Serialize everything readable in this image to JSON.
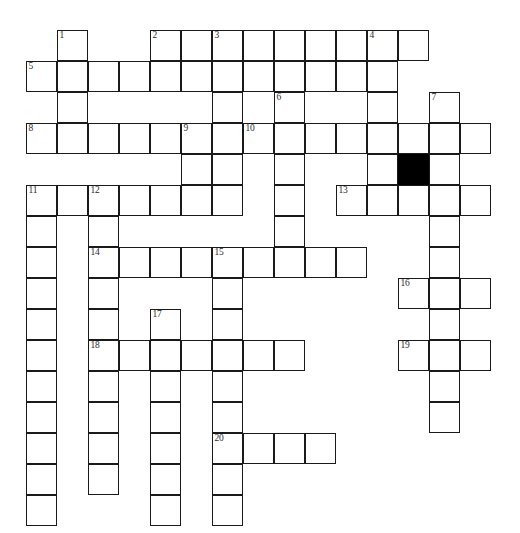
{
  "puzzle": {
    "title": "Crossword Puzzle Grid",
    "grid": {
      "columns": 15,
      "rows": 16,
      "cell_size": 31,
      "origin_x": 26,
      "origin_y": 30,
      "border_color": "#1a1a1a",
      "cell_fill": "#ffffff",
      "blocked_fill": "#000000",
      "background": "#ffffff"
    },
    "blocked_cells": [
      {
        "col": 12,
        "row": 4
      }
    ],
    "numbers": [
      {
        "label": "1",
        "col": 1,
        "row": 0
      },
      {
        "label": "2",
        "col": 4,
        "row": 0
      },
      {
        "label": "3",
        "col": 6,
        "row": 0
      },
      {
        "label": "4",
        "col": 11,
        "row": 0
      },
      {
        "label": "5",
        "col": 0,
        "row": 1
      },
      {
        "label": "6",
        "col": 8,
        "row": 2
      },
      {
        "label": "7",
        "col": 13,
        "row": 2
      },
      {
        "label": "8",
        "col": 0,
        "row": 3
      },
      {
        "label": "9",
        "col": 5,
        "row": 3
      },
      {
        "label": "10",
        "col": 7,
        "row": 3
      },
      {
        "label": "11",
        "col": 0,
        "row": 5
      },
      {
        "label": "12",
        "col": 2,
        "row": 5
      },
      {
        "label": "13",
        "col": 10,
        "row": 5
      },
      {
        "label": "14",
        "col": 2,
        "row": 7
      },
      {
        "label": "15",
        "col": 6,
        "row": 7
      },
      {
        "label": "16",
        "col": 12,
        "row": 8
      },
      {
        "label": "17",
        "col": 4,
        "row": 9
      },
      {
        "label": "18",
        "col": 2,
        "row": 10
      },
      {
        "label": "19",
        "col": 12,
        "row": 10
      },
      {
        "label": "20",
        "col": 6,
        "row": 13
      }
    ],
    "open_cells": [
      {
        "col": 1,
        "row": 0
      },
      {
        "col": 4,
        "row": 0
      },
      {
        "col": 5,
        "row": 0
      },
      {
        "col": 6,
        "row": 0
      },
      {
        "col": 7,
        "row": 0
      },
      {
        "col": 8,
        "row": 0
      },
      {
        "col": 9,
        "row": 0
      },
      {
        "col": 10,
        "row": 0
      },
      {
        "col": 11,
        "row": 0
      },
      {
        "col": 12,
        "row": 0
      },
      {
        "col": 0,
        "row": 1
      },
      {
        "col": 1,
        "row": 1
      },
      {
        "col": 2,
        "row": 1
      },
      {
        "col": 3,
        "row": 1
      },
      {
        "col": 4,
        "row": 1
      },
      {
        "col": 5,
        "row": 1
      },
      {
        "col": 6,
        "row": 1
      },
      {
        "col": 7,
        "row": 1
      },
      {
        "col": 8,
        "row": 1
      },
      {
        "col": 9,
        "row": 1
      },
      {
        "col": 10,
        "row": 1
      },
      {
        "col": 11,
        "row": 1
      },
      {
        "col": 1,
        "row": 2
      },
      {
        "col": 6,
        "row": 2
      },
      {
        "col": 8,
        "row": 2
      },
      {
        "col": 11,
        "row": 2
      },
      {
        "col": 13,
        "row": 2
      },
      {
        "col": 0,
        "row": 3
      },
      {
        "col": 1,
        "row": 3
      },
      {
        "col": 2,
        "row": 3
      },
      {
        "col": 3,
        "row": 3
      },
      {
        "col": 4,
        "row": 3
      },
      {
        "col": 5,
        "row": 3
      },
      {
        "col": 6,
        "row": 3
      },
      {
        "col": 7,
        "row": 3
      },
      {
        "col": 8,
        "row": 3
      },
      {
        "col": 9,
        "row": 3
      },
      {
        "col": 10,
        "row": 3
      },
      {
        "col": 11,
        "row": 3
      },
      {
        "col": 12,
        "row": 3
      },
      {
        "col": 13,
        "row": 3
      },
      {
        "col": 14,
        "row": 3
      },
      {
        "col": 5,
        "row": 4
      },
      {
        "col": 6,
        "row": 4
      },
      {
        "col": 8,
        "row": 4
      },
      {
        "col": 11,
        "row": 4
      },
      {
        "col": 12,
        "row": 4
      },
      {
        "col": 13,
        "row": 4
      },
      {
        "col": 0,
        "row": 5
      },
      {
        "col": 1,
        "row": 5
      },
      {
        "col": 2,
        "row": 5
      },
      {
        "col": 3,
        "row": 5
      },
      {
        "col": 4,
        "row": 5
      },
      {
        "col": 5,
        "row": 5
      },
      {
        "col": 6,
        "row": 5
      },
      {
        "col": 8,
        "row": 5
      },
      {
        "col": 10,
        "row": 5
      },
      {
        "col": 11,
        "row": 5
      },
      {
        "col": 12,
        "row": 5
      },
      {
        "col": 13,
        "row": 5
      },
      {
        "col": 14,
        "row": 5
      },
      {
        "col": 0,
        "row": 6
      },
      {
        "col": 2,
        "row": 6
      },
      {
        "col": 8,
        "row": 6
      },
      {
        "col": 13,
        "row": 6
      },
      {
        "col": 0,
        "row": 7
      },
      {
        "col": 2,
        "row": 7
      },
      {
        "col": 3,
        "row": 7
      },
      {
        "col": 4,
        "row": 7
      },
      {
        "col": 5,
        "row": 7
      },
      {
        "col": 6,
        "row": 7
      },
      {
        "col": 7,
        "row": 7
      },
      {
        "col": 8,
        "row": 7
      },
      {
        "col": 9,
        "row": 7
      },
      {
        "col": 10,
        "row": 7
      },
      {
        "col": 13,
        "row": 7
      },
      {
        "col": 0,
        "row": 8
      },
      {
        "col": 2,
        "row": 8
      },
      {
        "col": 6,
        "row": 8
      },
      {
        "col": 12,
        "row": 8
      },
      {
        "col": 13,
        "row": 8
      },
      {
        "col": 14,
        "row": 8
      },
      {
        "col": 0,
        "row": 9
      },
      {
        "col": 2,
        "row": 9
      },
      {
        "col": 4,
        "row": 9
      },
      {
        "col": 6,
        "row": 9
      },
      {
        "col": 13,
        "row": 9
      },
      {
        "col": 0,
        "row": 10
      },
      {
        "col": 2,
        "row": 10
      },
      {
        "col": 3,
        "row": 10
      },
      {
        "col": 4,
        "row": 10
      },
      {
        "col": 5,
        "row": 10
      },
      {
        "col": 6,
        "row": 10
      },
      {
        "col": 7,
        "row": 10
      },
      {
        "col": 8,
        "row": 10
      },
      {
        "col": 12,
        "row": 10
      },
      {
        "col": 13,
        "row": 10
      },
      {
        "col": 14,
        "row": 10
      },
      {
        "col": 0,
        "row": 11
      },
      {
        "col": 2,
        "row": 11
      },
      {
        "col": 4,
        "row": 11
      },
      {
        "col": 6,
        "row": 11
      },
      {
        "col": 13,
        "row": 11
      },
      {
        "col": 0,
        "row": 12
      },
      {
        "col": 2,
        "row": 12
      },
      {
        "col": 4,
        "row": 12
      },
      {
        "col": 6,
        "row": 12
      },
      {
        "col": 13,
        "row": 12
      },
      {
        "col": 0,
        "row": 13
      },
      {
        "col": 2,
        "row": 13
      },
      {
        "col": 4,
        "row": 13
      },
      {
        "col": 6,
        "row": 13
      },
      {
        "col": 7,
        "row": 13
      },
      {
        "col": 8,
        "row": 13
      },
      {
        "col": 9,
        "row": 13
      },
      {
        "col": 0,
        "row": 14
      },
      {
        "col": 2,
        "row": 14
      },
      {
        "col": 4,
        "row": 14
      },
      {
        "col": 6,
        "row": 14
      },
      {
        "col": 0,
        "row": 15
      },
      {
        "col": 4,
        "row": 15
      },
      {
        "col": 6,
        "row": 15
      }
    ]
  }
}
